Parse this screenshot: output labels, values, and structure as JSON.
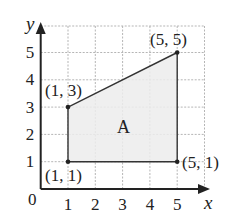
{
  "figure": {
    "axis_labels": {
      "x": "x",
      "y": "y"
    },
    "origin_label": "0",
    "x_ticks": [
      "1",
      "2",
      "3",
      "4",
      "5"
    ],
    "y_ticks": [
      "1",
      "2",
      "3",
      "4",
      "5"
    ],
    "region_label": "A",
    "points": [
      {
        "label": "(1, 1)",
        "x": 1,
        "y": 1
      },
      {
        "label": "(5, 1)",
        "x": 5,
        "y": 1
      },
      {
        "label": "(5, 5)",
        "x": 5,
        "y": 5
      },
      {
        "label": "(1, 3)",
        "x": 1,
        "y": 3
      }
    ],
    "colors": {
      "grid": "#b5b5b5",
      "axis": "#222222",
      "fill": "#ececec",
      "edge": "#333333"
    }
  }
}
